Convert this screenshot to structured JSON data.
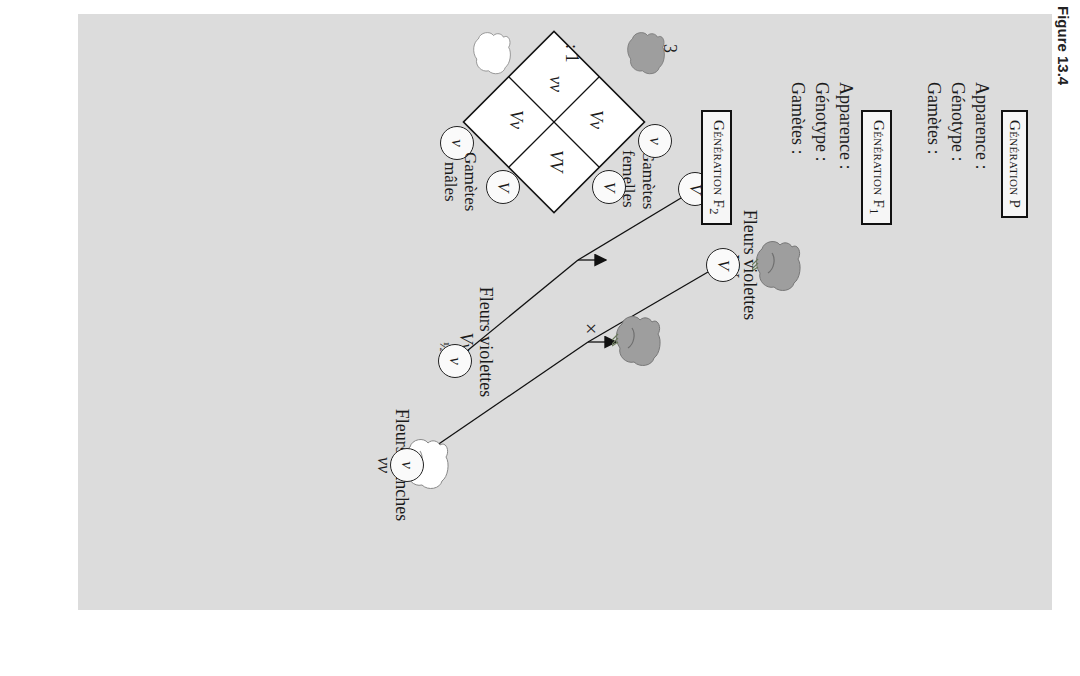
{
  "figure": {
    "label": "Figure 13.4"
  },
  "row_labels": {
    "appearance": "Apparence :",
    "genotype": "Génotype :",
    "gametes": "Gamètes :"
  },
  "generations": {
    "p": {
      "box_main": "Génération ",
      "box_suffix": "P",
      "cross_symbol": "×",
      "parent_left": {
        "appearance": "Fleurs violettes",
        "genotype": "VV",
        "gamete": "V",
        "flower": "purple-flower-icon"
      },
      "parent_right": {
        "appearance": "Fleurs blanches",
        "genotype": "vv",
        "gamete": "v",
        "flower": "white-flower-icon"
      }
    },
    "f1": {
      "box_main": "Génération F",
      "box_sub": "1",
      "appearance": "Fleurs violettes",
      "genotype": "Vv",
      "gamete_left": "V",
      "gamete_right": "v",
      "fraction_left": "½",
      "fraction_right": "½"
    },
    "f2": {
      "box_main": "Génération F",
      "box_sub": "2",
      "female_gametes_label_1": "Gamètes",
      "female_gametes_label_2": "femelles",
      "male_gametes_label_1": "Gamètes",
      "male_gametes_label_2": "mâles",
      "female_gametes": [
        "V",
        "v"
      ],
      "male_gametes": [
        "V",
        "v"
      ],
      "punnett": [
        {
          "genotype": "VV",
          "color": "purple"
        },
        {
          "genotype": "Vv",
          "color": "purple"
        },
        {
          "genotype": "Vv",
          "color": "purple"
        },
        {
          "genotype": "vv",
          "color": "white"
        }
      ],
      "ratio_purple": "3",
      "ratio_sep": ": 1"
    }
  },
  "colors": {
    "panel": "#dcdcdc",
    "purple_flower": "#9e9e9e",
    "white_flower": "#ffffff",
    "line": "#111111"
  }
}
